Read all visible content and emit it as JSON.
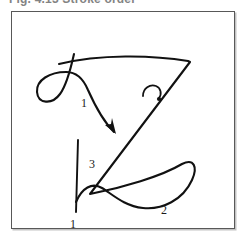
{
  "figure": {
    "caption": "Fig. 4.13  Stroke order",
    "border_color": "#585858",
    "ink_color": "#111111",
    "background": "#ffffff",
    "width": 248,
    "height": 243
  },
  "diagram": {
    "stroke_count": 3,
    "labels": [
      {
        "id": "label-1-top",
        "text": "1",
        "x": 80,
        "y": 101
      },
      {
        "id": "label-3-middle",
        "text": "3",
        "x": 88,
        "y": 162
      },
      {
        "id": "label-1-bottom",
        "text": "1",
        "x": 82,
        "y": 225
      },
      {
        "id": "label-2-right",
        "text": "2",
        "x": 160,
        "y": 210
      }
    ],
    "strokes": [
      {
        "id": "stroke-main-z",
        "name": "main z body"
      },
      {
        "id": "stroke-entry-loop",
        "name": "entry loop flourish"
      },
      {
        "id": "stroke-vertical-stem",
        "name": "vertical stem"
      },
      {
        "id": "stroke-lower-curve",
        "name": "lower wave curve"
      }
    ],
    "arrows": [
      {
        "id": "arrow-direction-1",
        "name": "downward direction arrow"
      },
      {
        "id": "arrow-hook-small",
        "name": "small curl arrow"
      }
    ]
  }
}
